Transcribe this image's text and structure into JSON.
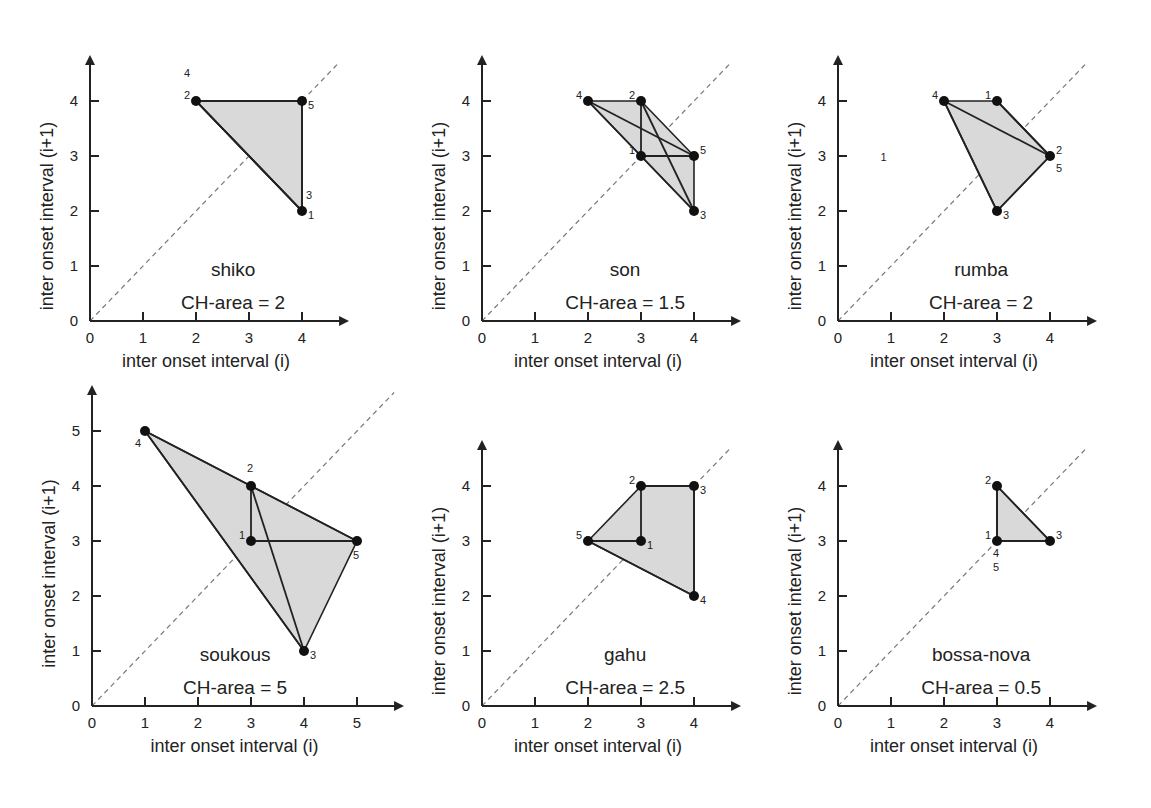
{
  "chart_data": [
    {
      "type": "scatter",
      "title": "shiko",
      "annotation": "CH-area = 2",
      "xlabel": "inter onset interval (i)",
      "ylabel": "inter onset interval (i+1)",
      "xticks": [
        0,
        1,
        2,
        3,
        4
      ],
      "yticks": [
        0,
        1,
        2,
        3,
        4
      ],
      "xlim": [
        0,
        4.8
      ],
      "ylim": [
        0,
        4.8
      ],
      "points": [
        {
          "label": "1",
          "x": 4,
          "y": 2
        },
        {
          "label": "2",
          "x": 2,
          "y": 4
        },
        {
          "label": "3",
          "x": 4,
          "y": 2
        },
        {
          "label": "4",
          "x": 2,
          "y": 4
        },
        {
          "label": "5",
          "x": 4,
          "y": 4
        }
      ],
      "convex_hull": [
        [
          2,
          4
        ],
        [
          4,
          4
        ],
        [
          4,
          2
        ]
      ],
      "diagonal": "y = x dashed"
    },
    {
      "type": "scatter",
      "title": "son",
      "annotation": "CH-area = 1.5",
      "xlabel": "inter onset interval (i)",
      "ylabel": "inter onset interval (i+1)",
      "xticks": [
        0,
        1,
        2,
        3,
        4
      ],
      "yticks": [
        0,
        1,
        2,
        3,
        4
      ],
      "xlim": [
        0,
        4.8
      ],
      "ylim": [
        0,
        4.8
      ],
      "points": [
        {
          "label": "1",
          "x": 3,
          "y": 3
        },
        {
          "label": "2",
          "x": 3,
          "y": 4
        },
        {
          "label": "3",
          "x": 4,
          "y": 2
        },
        {
          "label": "4",
          "x": 2,
          "y": 4
        },
        {
          "label": "5",
          "x": 4,
          "y": 3
        }
      ],
      "convex_hull": [
        [
          2,
          4
        ],
        [
          3,
          4
        ],
        [
          4,
          3
        ],
        [
          4,
          2
        ]
      ],
      "diagonal": "y = x dashed"
    },
    {
      "type": "scatter",
      "title": "rumba",
      "annotation": "CH-area = 2",
      "xlabel": "inter onset interval (i)",
      "ylabel": "inter onset interval (i+1)",
      "xticks": [
        0,
        1,
        2,
        3,
        4
      ],
      "yticks": [
        0,
        1,
        2,
        3,
        4
      ],
      "xlim": [
        0,
        4.8
      ],
      "ylim": [
        0,
        4.8
      ],
      "points": [
        {
          "label": "1",
          "x": 3,
          "y": 4
        },
        {
          "label": "2",
          "x": 4,
          "y": 3
        },
        {
          "label": "3",
          "x": 3,
          "y": 2
        },
        {
          "label": "4",
          "x": 2,
          "y": 4
        },
        {
          "label": "5",
          "x": 4,
          "y": 3
        }
      ],
      "convex_hull": [
        [
          2,
          4
        ],
        [
          3,
          4
        ],
        [
          4,
          3
        ],
        [
          3,
          2
        ]
      ],
      "diagonal": "y = x dashed"
    },
    {
      "type": "scatter",
      "title": "soukous",
      "annotation": "CH-area = 5",
      "xlabel": "inter onset interval (i)",
      "ylabel": "inter onset interval (i+1)",
      "xticks": [
        0,
        1,
        2,
        3,
        4,
        5
      ],
      "yticks": [
        0,
        1,
        2,
        3,
        4,
        5
      ],
      "xlim": [
        0,
        5.3
      ],
      "ylim": [
        0,
        5.3
      ],
      "points": [
        {
          "label": "1",
          "x": 3,
          "y": 3
        },
        {
          "label": "2",
          "x": 3,
          "y": 4
        },
        {
          "label": "3",
          "x": 4,
          "y": 1
        },
        {
          "label": "4",
          "x": 1,
          "y": 5
        },
        {
          "label": "5",
          "x": 5,
          "y": 3
        }
      ],
      "convex_hull": [
        [
          1,
          5
        ],
        [
          5,
          3
        ],
        [
          4,
          1
        ]
      ],
      "diagonal": "y = x dashed"
    },
    {
      "type": "scatter",
      "title": "gahu",
      "annotation": "CH-area = 2.5",
      "xlabel": "inter onset interval (i)",
      "ylabel": "inter onset interval (i+1)",
      "xticks": [
        0,
        1,
        2,
        3,
        4
      ],
      "yticks": [
        0,
        1,
        2,
        3,
        4
      ],
      "xlim": [
        0,
        4.8
      ],
      "ylim": [
        0,
        4.8
      ],
      "points": [
        {
          "label": "1",
          "x": 3,
          "y": 3
        },
        {
          "label": "2",
          "x": 3,
          "y": 4
        },
        {
          "label": "3",
          "x": 4,
          "y": 4
        },
        {
          "label": "4",
          "x": 4,
          "y": 2
        },
        {
          "label": "5",
          "x": 2,
          "y": 3
        }
      ],
      "convex_hull": [
        [
          2,
          3
        ],
        [
          3,
          4
        ],
        [
          4,
          4
        ],
        [
          4,
          2
        ]
      ],
      "diagonal": "y = x dashed"
    },
    {
      "type": "scatter",
      "title": "bossa-nova",
      "annotation": "CH-area = 0.5",
      "xlabel": "inter onset interval (i)",
      "ylabel": "inter onset interval (i+1)",
      "xticks": [
        0,
        1,
        2,
        3,
        4
      ],
      "yticks": [
        0,
        1,
        2,
        3,
        4
      ],
      "xlim": [
        0,
        4.8
      ],
      "ylim": [
        0,
        4.8
      ],
      "points": [
        {
          "label": "1",
          "x": 3,
          "y": 3
        },
        {
          "label": "2",
          "x": 3,
          "y": 4
        },
        {
          "label": "3",
          "x": 4,
          "y": 3
        },
        {
          "label": "4",
          "x": 3,
          "y": 3
        },
        {
          "label": "5",
          "x": 3,
          "y": 3
        }
      ],
      "convex_hull": [
        [
          3,
          3
        ],
        [
          3,
          4
        ],
        [
          4,
          3
        ]
      ],
      "diagonal": "y = x dashed"
    }
  ],
  "labels": {
    "xlabel": "inter onset interval (i)",
    "ylabel": "inter onset interval (i+1)",
    "stray_rumba_label": "1"
  },
  "panels": {
    "shiko": {
      "name": "shiko",
      "area": "CH-area = 2"
    },
    "son": {
      "name": "son",
      "area": "CH-area = 1.5"
    },
    "rumba": {
      "name": "rumba",
      "area": "CH-area = 2"
    },
    "soukous": {
      "name": "soukous",
      "area": "CH-area = 5"
    },
    "gahu": {
      "name": "gahu",
      "area": "CH-area = 2.5"
    },
    "bossa": {
      "name": "bossa-nova",
      "area": "CH-area = 0.5"
    }
  },
  "ticks": [
    "0",
    "1",
    "2",
    "3",
    "4",
    "5"
  ],
  "colors": {
    "hull_fill": "#d9d9d9",
    "stroke": "#222222",
    "diagonal": "#777777"
  }
}
